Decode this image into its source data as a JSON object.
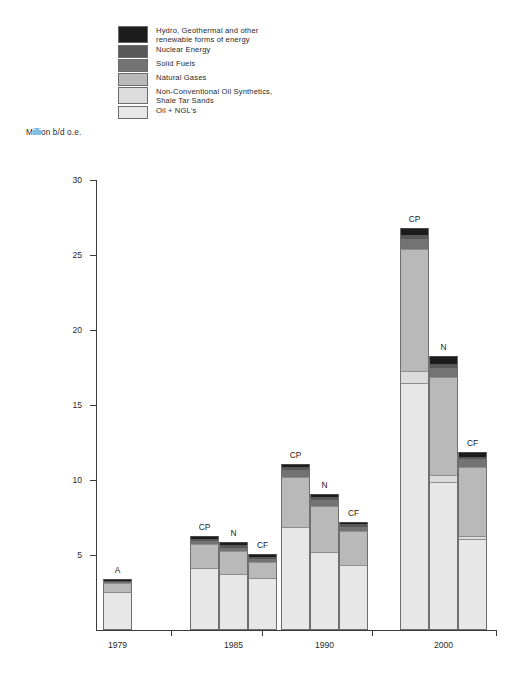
{
  "axis_title": "Million b/d o.e.",
  "legend": {
    "items": [
      {
        "name": "hydro-geothermal",
        "label": "Hydro, Geothermal and other\nrenewable forms of energy",
        "color": "#1c1c1c"
      },
      {
        "name": "nuclear-energy",
        "label": "Nuclear Energy",
        "color": "#585858"
      },
      {
        "name": "solid-fuels",
        "label": "Solid Fuels",
        "color": "#737373"
      },
      {
        "name": "natural-gases",
        "label": "Natural Gases",
        "color": "#b9b9b9"
      },
      {
        "name": "non-conventional-oil",
        "label": "Non-Conventional Oil Synthetics,\nShale Tar Sands",
        "color": "#dcdcdc"
      },
      {
        "name": "oil-ngl",
        "label": "Oil + NGL's",
        "color": "#e7e7e7"
      }
    ]
  },
  "chart_data": {
    "type": "bar",
    "subtype": "stacked-grouped",
    "title": "",
    "xlabel": "",
    "ylabel": "Million b/d o.e.",
    "ylim": [
      0,
      30
    ],
    "yticks": [
      0,
      5,
      10,
      15,
      20,
      25,
      30
    ],
    "ytick_labels": [
      "",
      "5",
      "10",
      "15",
      "20",
      "25",
      "30"
    ],
    "grid": false,
    "legend_position": "top-left",
    "categories": [
      "1979",
      "1985",
      "1990",
      "2000"
    ],
    "series": [
      {
        "name": "Oil + NGL's",
        "color": "#e7e7e7"
      },
      {
        "name": "Non-Conventional Oil Synthetics, Shale Tar Sands",
        "color": "#dcdcdc"
      },
      {
        "name": "Natural Gases",
        "color": "#b9b9b9"
      },
      {
        "name": "Solid Fuels",
        "color": "#737373"
      },
      {
        "name": "Nuclear Energy",
        "color": "#585858"
      },
      {
        "name": "Hydro, Geothermal and other renewable forms of energy",
        "color": "#1c1c1c"
      }
    ],
    "groups": [
      {
        "category": "1979",
        "bars": [
          {
            "label": "A",
            "total": 3.4,
            "values": {
              "oil_ngl": 2.55,
              "non_conventional": 0.0,
              "natural_gases": 0.6,
              "solid_fuels": 0.05,
              "nuclear": 0.05,
              "hydro": 0.15
            }
          }
        ]
      },
      {
        "category": "1985",
        "bars": [
          {
            "label": "CP",
            "total": 6.3,
            "values": {
              "oil_ngl": 4.15,
              "non_conventional": 0.0,
              "natural_gases": 1.6,
              "solid_fuels": 0.2,
              "nuclear": 0.15,
              "hydro": 0.2
            }
          },
          {
            "label": "N",
            "total": 5.9,
            "values": {
              "oil_ngl": 3.75,
              "non_conventional": 0.0,
              "natural_gases": 1.55,
              "solid_fuels": 0.2,
              "nuclear": 0.15,
              "hydro": 0.25
            }
          },
          {
            "label": "CF",
            "total": 5.1,
            "values": {
              "oil_ngl": 3.5,
              "non_conventional": 0.0,
              "natural_gases": 1.05,
              "solid_fuels": 0.2,
              "nuclear": 0.15,
              "hydro": 0.2
            }
          }
        ]
      },
      {
        "category": "1990",
        "bars": [
          {
            "label": "CP",
            "total": 11.1,
            "values": {
              "oil_ngl": 6.85,
              "non_conventional": 0.0,
              "natural_gases": 3.35,
              "solid_fuels": 0.45,
              "nuclear": 0.2,
              "hydro": 0.25
            }
          },
          {
            "label": "N",
            "total": 9.1,
            "values": {
              "oil_ngl": 5.2,
              "non_conventional": 0.0,
              "natural_gases": 3.1,
              "solid_fuels": 0.4,
              "nuclear": 0.2,
              "hydro": 0.2
            }
          },
          {
            "label": "CF",
            "total": 7.2,
            "values": {
              "oil_ngl": 4.35,
              "non_conventional": 0.0,
              "natural_gases": 2.25,
              "solid_fuels": 0.3,
              "nuclear": 0.15,
              "hydro": 0.15
            }
          }
        ]
      },
      {
        "category": "2000",
        "bars": [
          {
            "label": "CP",
            "total": 26.8,
            "values": {
              "oil_ngl": 16.45,
              "non_conventional": 0.85,
              "natural_gases": 8.1,
              "solid_fuels": 0.7,
              "nuclear": 0.25,
              "hydro": 0.45
            }
          },
          {
            "label": "N",
            "total": 18.3,
            "values": {
              "oil_ngl": 9.85,
              "non_conventional": 0.5,
              "natural_gases": 6.55,
              "solid_fuels": 0.6,
              "nuclear": 0.25,
              "hydro": 0.55
            }
          },
          {
            "label": "CF",
            "total": 11.9,
            "values": {
              "oil_ngl": 6.05,
              "non_conventional": 0.25,
              "natural_gases": 4.6,
              "solid_fuels": 0.5,
              "nuclear": 0.15,
              "hydro": 0.35
            }
          }
        ]
      }
    ]
  },
  "axes": {
    "y_labels": [
      "30",
      "25",
      "20",
      "15",
      "10",
      "5"
    ],
    "x_labels": [
      "1979",
      "1985",
      "1990",
      "2000"
    ]
  }
}
